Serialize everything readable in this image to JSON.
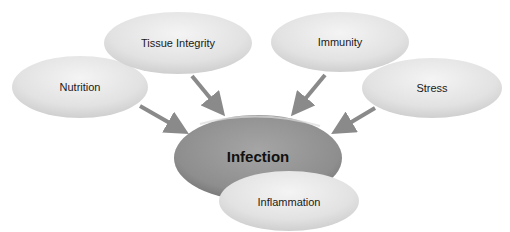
{
  "diagram": {
    "center": {
      "label": "Infection",
      "color": "#8f8f8f"
    },
    "factors": [
      {
        "label": "Nutrition"
      },
      {
        "label": "Tissue Integrity"
      },
      {
        "label": "Immunity"
      },
      {
        "label": "Stress"
      }
    ],
    "outcome": {
      "label": "Inflammation"
    },
    "colors": {
      "node_light": "#dcdcdc",
      "arrow": "#8a8a8a"
    }
  }
}
